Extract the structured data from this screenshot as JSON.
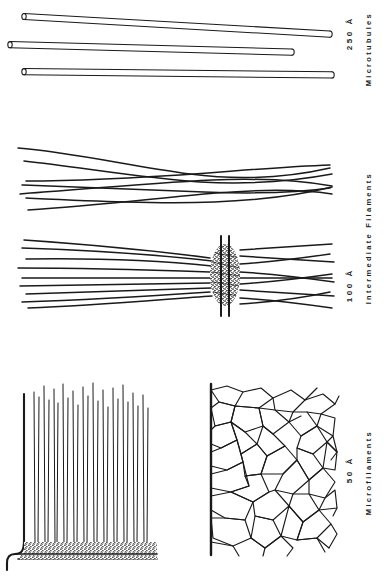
{
  "figure": {
    "background": "#ffffff",
    "ink": "#1a1a1a",
    "width": 384,
    "height": 585
  },
  "groups": [
    {
      "id": "microtubules",
      "name_label": "Microtubules",
      "scale_label": "250 Å",
      "panels": [
        {
          "id": "microtubule-tubes",
          "name": "three-hollow-tubules",
          "element_count": 3,
          "style": "long hollow cylinders with open elliptical ends"
        }
      ]
    },
    {
      "id": "intermediate-filaments",
      "name_label": "Intermediate Filaments",
      "scale_label": "100 Å",
      "panels": [
        {
          "id": "if-wavy-bundle",
          "name": "crossing-wavy-filaments",
          "element_count": 7,
          "style": "long gently curving filaments that cross near mid-field"
        },
        {
          "id": "if-desmosome",
          "name": "desmosome-plaque-with-filaments",
          "element_count": 10,
          "style": "filaments converging on a stippled dense plaque between two membranes"
        }
      ]
    },
    {
      "id": "microfilaments",
      "name_label": "Microfilaments",
      "scale_label": "50 Å",
      "panels": [
        {
          "id": "mf-microvillus-core",
          "name": "microvillus-core-bundle",
          "element_count": 26,
          "style": "parallel vertical actin filaments rooted in a stippled terminal web"
        },
        {
          "id": "mf-cortical-network",
          "name": "cortical-actin-meshwork",
          "style": "irregular polygonal network anchored on a vertical membrane line"
        }
      ]
    }
  ]
}
